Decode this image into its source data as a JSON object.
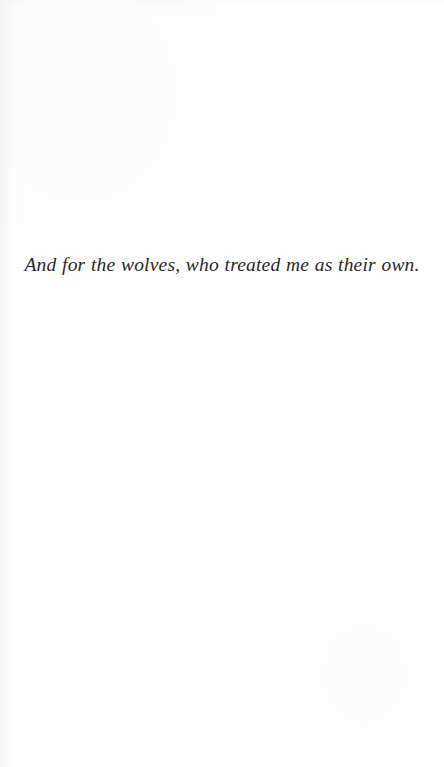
{
  "page": {
    "kind": "book-dedication-page",
    "background_color": "#fefefe",
    "width": 444,
    "height": 767
  },
  "dedication": {
    "text": "And for the wolves, who treated me as their own.",
    "style": "italic",
    "alignment": "center",
    "text_color": "#2b2a28"
  }
}
